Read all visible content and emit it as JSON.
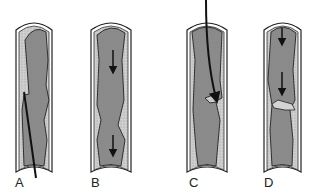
{
  "figure": {
    "panels": [
      {
        "label": "A",
        "description": "vessel with guidewire crossing plaque"
      },
      {
        "label": "B",
        "description": "vessel with downward flow arrows"
      },
      {
        "label": "C",
        "description": "vessel with curved guidewire entering flap"
      },
      {
        "label": "D",
        "description": "vessel with flow arrows and intimal flap"
      }
    ],
    "colors": {
      "wall": "#ffffff",
      "outline": "#222222",
      "plaque": "#c9c9c9",
      "lumen": "#8f8f8f"
    }
  }
}
